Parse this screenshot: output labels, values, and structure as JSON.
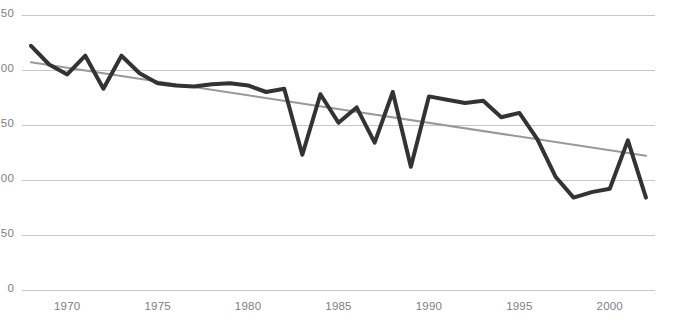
{
  "chart_data": {
    "type": "line",
    "title": "",
    "xlabel": "",
    "ylabel": "",
    "xlim": [
      1967.5,
      2002.5
    ],
    "ylim": [
      0,
      250
    ],
    "grid": true,
    "legend": false,
    "grid_color": "#c8c8c8",
    "axis_label_color": "#808080",
    "y_ticks": [
      250,
      200,
      150,
      100,
      50,
      0
    ],
    "y_tick_labels": [
      "50",
      "00",
      "50",
      "00",
      "50",
      "0"
    ],
    "y_tick_labels_note": "left-clipped by image crop; full values are 250, 200, 150, 100, 50, 0",
    "x_ticks": [
      1970,
      1975,
      1980,
      1985,
      1990,
      1995,
      2000
    ],
    "x_tick_labels": [
      "1970",
      "1975",
      "1980",
      "1985",
      "1990",
      "1995",
      "2000"
    ],
    "series": [
      {
        "name": "data",
        "color": "#333333",
        "line_width": 4,
        "x": [
          1968,
          1969,
          1970,
          1971,
          1972,
          1973,
          1974,
          1975,
          1976,
          1977,
          1978,
          1979,
          1980,
          1981,
          1982,
          1983,
          1984,
          1985,
          1986,
          1987,
          1988,
          1989,
          1990,
          1991,
          1992,
          1993,
          1994,
          1995,
          1996,
          1997,
          1998,
          1999,
          2000,
          2001,
          2002
        ],
        "values": [
          222,
          205,
          196,
          213,
          183,
          213,
          197,
          188,
          186,
          185,
          187,
          188,
          186,
          180,
          183,
          123,
          178,
          152,
          166,
          134,
          180,
          112,
          176,
          173,
          170,
          172,
          157,
          161,
          137,
          103,
          84,
          89,
          92,
          136,
          84
        ]
      },
      {
        "name": "trendline",
        "color": "#999999",
        "line_width": 2,
        "x": [
          1968,
          2002
        ],
        "values": [
          207,
          122
        ]
      }
    ]
  }
}
